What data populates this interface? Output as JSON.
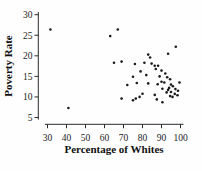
{
  "chart_data": {
    "type": "scatter",
    "title": "",
    "xlabel": "Percentage of Whites",
    "ylabel": "Poverty Rate",
    "xlim": [
      26,
      102
    ],
    "ylim": [
      3,
      31.5
    ],
    "x_ticks": [
      30,
      40,
      50,
      60,
      70,
      80,
      90,
      100
    ],
    "y_ticks": [
      5,
      10,
      15,
      20,
      25,
      30
    ],
    "grid": false,
    "legend": "none",
    "marker_color": "#1b1b1b",
    "axis_color": "#2a2a2a",
    "points": [
      [
        31.5,
        26.4
      ],
      [
        41,
        7.3
      ],
      [
        63,
        24.8
      ],
      [
        67,
        26.4
      ],
      [
        97.5,
        22.2
      ],
      [
        93.5,
        20.5
      ],
      [
        83,
        20.3
      ],
      [
        84,
        19.6
      ],
      [
        65,
        18.3
      ],
      [
        69,
        18.6
      ],
      [
        76,
        18.0
      ],
      [
        81,
        18.3
      ],
      [
        84.8,
        18.1
      ],
      [
        86.4,
        17.6
      ],
      [
        88.2,
        17.6
      ],
      [
        87,
        16.8
      ],
      [
        79,
        16.2
      ],
      [
        90,
        16.4
      ],
      [
        92,
        15.7
      ],
      [
        75,
        14.9
      ],
      [
        82,
        15.3
      ],
      [
        89,
        15.0
      ],
      [
        93,
        14.8
      ],
      [
        94.5,
        14.3
      ],
      [
        72,
        12.9
      ],
      [
        77,
        13.4
      ],
      [
        83,
        13.3
      ],
      [
        90,
        13.7
      ],
      [
        91.5,
        13.5
      ],
      [
        88,
        13.1
      ],
      [
        95,
        13.0
      ],
      [
        96,
        12.6
      ],
      [
        99.5,
        13.5
      ],
      [
        94,
        12.2
      ],
      [
        90.5,
        12.0
      ],
      [
        93.5,
        11.7
      ],
      [
        92.7,
        11.1
      ],
      [
        95,
        11.2
      ],
      [
        97.3,
        11.9
      ],
      [
        98.7,
        11.5
      ],
      [
        97,
        10.75
      ],
      [
        98.4,
        10.4
      ],
      [
        94.5,
        10.2
      ],
      [
        95.8,
        10.0
      ],
      [
        86.5,
        10.5
      ],
      [
        87.5,
        9.4
      ],
      [
        90.5,
        8.7
      ],
      [
        69,
        9.6
      ],
      [
        75,
        9.2
      ],
      [
        76.5,
        9.6
      ],
      [
        78.5,
        10.0
      ],
      [
        80,
        10.8
      ]
    ]
  }
}
